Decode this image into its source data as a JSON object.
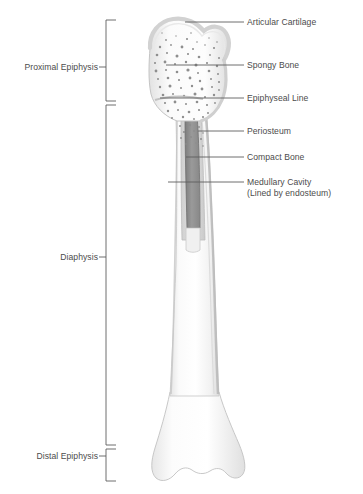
{
  "figure": {
    "type": "anatomical-diagram",
    "background_color": "#ffffff",
    "line_color": "#6b6b6b",
    "text_color": "#4c4c4c"
  },
  "right_labels": [
    {
      "id": "articular-cartilage",
      "text": "Articular Cartilage",
      "x": 247,
      "y": 18,
      "leader": {
        "x1": 185,
        "y1": 22,
        "x2": 244,
        "y2": 22
      }
    },
    {
      "id": "spongy-bone",
      "text": "Spongy Bone",
      "x": 247,
      "y": 61,
      "leader": {
        "x1": 166,
        "y1": 65,
        "x2": 244,
        "y2": 65
      }
    },
    {
      "id": "epiphyseal-line",
      "text": "Epiphyseal Line",
      "x": 247,
      "y": 94,
      "leader": {
        "x1": 160,
        "y1": 98,
        "x2": 244,
        "y2": 98
      }
    },
    {
      "id": "periosteum",
      "text": "Periosteum",
      "x": 247,
      "y": 127,
      "leader": {
        "x1": 198,
        "y1": 131,
        "x2": 244,
        "y2": 131
      }
    },
    {
      "id": "compact-bone",
      "text": "Compact Bone",
      "x": 247,
      "y": 153,
      "leader": {
        "x1": 186,
        "y1": 157,
        "x2": 244,
        "y2": 157
      }
    },
    {
      "id": "medullary-cavity",
      "text": "Medullary Cavity",
      "x": 247,
      "y": 178,
      "leader": {
        "x1": 168,
        "y1": 182,
        "x2": 244,
        "y2": 182
      }
    }
  ],
  "right_label_sublines": [
    {
      "id": "medullary-cavity-note",
      "text": "(Lined by endosteum)",
      "x": 247,
      "y": 189
    }
  ],
  "left_labels": [
    {
      "id": "proximal-epiphysis",
      "text": "Proximal Epiphysis",
      "x": 12,
      "y": 63,
      "bracket": {
        "x": 106,
        "y_top": 20,
        "y_bottom": 101,
        "tick_y": 67
      }
    },
    {
      "id": "diaphysis",
      "text": "Diaphysis",
      "x": 56,
      "y": 253,
      "bracket": {
        "x": 106,
        "y_top": 105,
        "y_bottom": 445,
        "tick_y": 257
      }
    },
    {
      "id": "distal-epiphysis",
      "text": "Distal Epiphysis",
      "x": 25,
      "y": 452,
      "bracket": {
        "x": 106,
        "y_top": 449,
        "y_bottom": 481,
        "tick_y": 456
      }
    }
  ],
  "bone_regions": [
    {
      "id": "articular-cartilage-cap",
      "fill": "#e9e9e9",
      "description": "smooth outer cap over proximal head"
    },
    {
      "id": "spongy-bone-trabeculae",
      "fill": "#f6f6f6",
      "speckle": "#8c8c8c",
      "description": "speckled trabecular texture inside epiphysis"
    },
    {
      "id": "compact-bone-wall",
      "fill": "#d9d9d9",
      "description": "dense cortical wall of the shaft"
    },
    {
      "id": "medullary-cavity-core",
      "fill": "#8f8f8f",
      "description": "dark marrow cavity in shaft cutaway"
    },
    {
      "id": "periosteum-layer",
      "fill": "#cfcfcf",
      "description": "thin outer membrane along shaft"
    },
    {
      "id": "distal-epiphysis-body",
      "fill": "#fbfbfb",
      "description": "flared condyles at distal end"
    }
  ]
}
